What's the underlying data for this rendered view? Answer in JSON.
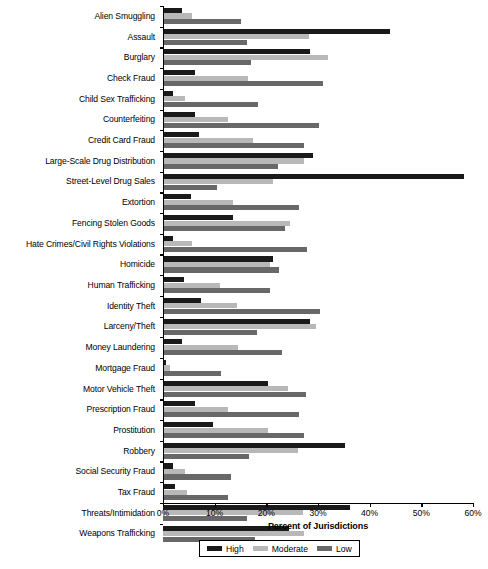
{
  "chart_data": {
    "type": "bar",
    "orientation": "horizontal",
    "title": "",
    "xlabel": "Percent of Jurisdictions",
    "ylabel": "",
    "xlim": [
      0,
      60
    ],
    "xticks": [
      0,
      10,
      20,
      30,
      40,
      50,
      60
    ],
    "xtick_labels": [
      "0%",
      "10%",
      "20%",
      "30%",
      "40%",
      "50%",
      "60%"
    ],
    "grid": false,
    "legend_position": "bottom",
    "legend": [
      "High",
      "Moderate",
      "Low"
    ],
    "colors": {
      "high": "#1a1a1a",
      "moderate": "#b8b8b8",
      "low": "#686868",
      "axis": "#000000",
      "background": "#ffffff"
    },
    "categories": [
      "Alien Smuggling",
      "Assault",
      "Burglary",
      "Check Fraud",
      "Child Sex Trafficking",
      "Counterfeiting",
      "Credit Card Fraud",
      "Large-Scale Drug Distribution",
      "Street-Level Drug Sales",
      "Extortion",
      "Fencing Stolen Goods",
      "Hate Crimes/Civil Rights Violations",
      "Homicide",
      "Human Trafficking",
      "Identity Theft",
      "Larceny/Theft",
      "Money Laundering",
      "Mortgage Fraud",
      "Motor Vehicle Theft",
      "Prescription Fraud",
      "Prostitution",
      "Robbery",
      "Social Security Fraud",
      "Tax Fraud",
      "Threats/Intimidation",
      "Weapons Trafficking"
    ],
    "series": [
      {
        "name": "High",
        "key": "high",
        "values": [
          3.7,
          44.0,
          28.5,
          6.2,
          1.9,
          6.2,
          7.0,
          29.0,
          58.2,
          5.5,
          13.5,
          2.0,
          21.3,
          4.1,
          7.3,
          28.4,
          3.6,
          0.6,
          20.4,
          6.2,
          9.7,
          35.2,
          2.0,
          2.3,
          36.2,
          24.3
        ]
      },
      {
        "name": "Moderate",
        "key": "moderate",
        "values": [
          5.6,
          28.2,
          32.0,
          16.4,
          4.2,
          12.6,
          17.4,
          27.3,
          21.3,
          13.6,
          24.6,
          5.7,
          20.7,
          11.0,
          14.3,
          29.7,
          14.5,
          1.4,
          24.2,
          12.6,
          20.4,
          26.2,
          4.2,
          4.6,
          27.1,
          27.3
        ]
      },
      {
        "name": "Low",
        "key": "low",
        "values": [
          15.0,
          16.2,
          17.1,
          31.0,
          18.4,
          30.2,
          27.3,
          22.3,
          10.4,
          26.4,
          23.6,
          27.8,
          22.5,
          20.7,
          30.3,
          18.2,
          23.0,
          11.2,
          27.6,
          26.4,
          27.3,
          16.7,
          13.1,
          12.6,
          16.3,
          17.8
        ]
      }
    ]
  }
}
